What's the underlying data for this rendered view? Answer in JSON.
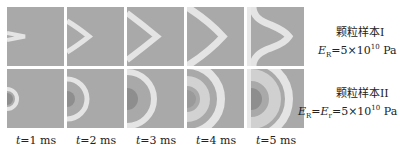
{
  "figure": {
    "rows": [
      {
        "label": "颗粒样本I",
        "param_symbol": "E",
        "param_sub": "R",
        "param_rest": "=5×10",
        "param_exp": "10",
        "param_unit": " Pa",
        "pattern": "chevron"
      },
      {
        "label": "颗粒样本II",
        "param_symbol": "E",
        "param_sub": "R",
        "param_mid": "=E",
        "param_mid_sub": "r",
        "param_rest": "=5×10",
        "param_exp": "10",
        "param_unit": " Pa",
        "pattern": "ring"
      }
    ],
    "time_labels": [
      {
        "var": "t",
        "text": "=1 ms"
      },
      {
        "var": "t",
        "text": "=2 ms"
      },
      {
        "var": "t",
        "text": "=3 ms"
      },
      {
        "var": "t",
        "text": "=4 ms"
      },
      {
        "var": "t",
        "text": "=5 ms"
      }
    ],
    "colors": {
      "background_field": "#a9a9a9",
      "wave_front": "#e6e6e6",
      "core_dark": "#8c8c8c"
    }
  }
}
